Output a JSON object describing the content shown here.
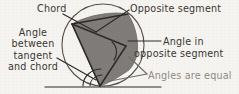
{
  "figure": {
    "background_color": "#f6f4f1",
    "ink_color": "#3a3632",
    "faded_ink_color": "#8e8a86",
    "segment_fill_color": "#7f7c79",
    "width": 239,
    "height": 94
  },
  "labels": {
    "chord": "Chord",
    "opposite_segment": "Opposite segment",
    "angle_in": "Angle in",
    "angle_in_opposite_segment": "opposite segment",
    "angles_are_equal": "Angles are equal",
    "angle_between_line1": "Angle",
    "angle_between_line2": "between",
    "angle_between_line3": "tangent",
    "angle_between_line4": "and chord"
  },
  "geometry": {
    "circle": {
      "cx": 103,
      "cy": 45,
      "r": 41
    },
    "tangent_line": {
      "x1": 45,
      "y1": 87,
      "x2": 161,
      "y2": 87
    },
    "tangent_point": {
      "x": 100,
      "y": 86
    },
    "chord_endpoints": [
      {
        "x": 72,
        "y": 24
      },
      {
        "x": 100,
        "y": 86
      }
    ],
    "segment_vertices": [
      {
        "x": 72,
        "y": 24
      },
      {
        "x": 128,
        "y": 14
      },
      {
        "x": 137,
        "y": 55
      },
      {
        "x": 126,
        "y": 72
      },
      {
        "x": 100,
        "y": 86
      }
    ],
    "inscribed_angle_vertex": {
      "x": 126,
      "y": 46
    },
    "small_arc_marker": {
      "cx": 100,
      "cy": 86,
      "r": 17
    }
  },
  "leader_lines": [
    {
      "name": "chord-leader",
      "x1": 63,
      "y1": 14,
      "x2": 96,
      "y2": 32
    },
    {
      "name": "opposite-segment-leader",
      "x1": 129,
      "y1": 10,
      "x2": 96,
      "y2": 32
    },
    {
      "name": "angle-in-leader",
      "x1": 161,
      "y1": 41,
      "x2": 128,
      "y2": 41
    },
    {
      "name": "angles-equal-leader-a",
      "x1": 147,
      "y1": 74,
      "x2": 110,
      "y2": 81
    },
    {
      "name": "angles-equal-leader-b",
      "x1": 147,
      "y1": 74,
      "x2": 128,
      "y2": 56
    },
    {
      "name": "tangent-chord-leader",
      "x1": 57,
      "y1": 58,
      "x2": 96,
      "y2": 80
    }
  ]
}
